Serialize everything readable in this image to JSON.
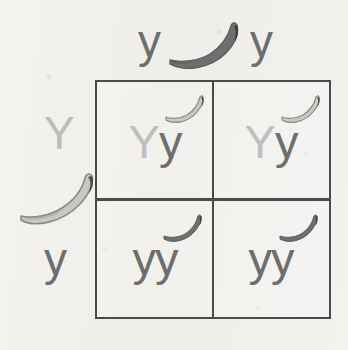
{
  "diagram": {
    "type": "punnett-square",
    "background_color": "#f2f1ee",
    "grid_line_color": "#4a4a4a"
  },
  "legend_colors": {
    "dominant_allele_text": "#bfbfbf",
    "recessive_allele_text": "#6e6e6e",
    "banana_light_fill": "#c9c8c4",
    "banana_light_stroke": "#8e8d89",
    "banana_dark_fill": "#6e6e6e",
    "banana_tip": "#4a4a4a"
  },
  "parents": {
    "top": {
      "alleles": [
        "y",
        "y"
      ],
      "allele_color": "#6e6e6e",
      "banana": {
        "icon": "banana-icon",
        "shade": "dark",
        "fill": "#6e6e6e"
      }
    },
    "left": {
      "alleles": [
        "Y",
        "y"
      ],
      "allele_colors": [
        "#bcbcbc",
        "#6e6e6e"
      ],
      "banana": {
        "icon": "banana-icon",
        "shade": "light",
        "fill": "#c9c8c4"
      }
    }
  },
  "cells": [
    {
      "id": "cell-top-left",
      "row": 0,
      "col": 0,
      "genotype": "Yy",
      "alleles": [
        {
          "symbol": "Y",
          "type": "dominant"
        },
        {
          "symbol": "y",
          "type": "recessive"
        }
      ],
      "banana": {
        "icon": "banana-icon",
        "shade": "light",
        "fill": "#c9c8c4"
      }
    },
    {
      "id": "cell-top-right",
      "row": 0,
      "col": 1,
      "genotype": "Yy",
      "alleles": [
        {
          "symbol": "Y",
          "type": "dominant"
        },
        {
          "symbol": "y",
          "type": "recessive"
        }
      ],
      "banana": {
        "icon": "banana-icon",
        "shade": "light",
        "fill": "#c9c8c4"
      }
    },
    {
      "id": "cell-bottom-left",
      "row": 1,
      "col": 0,
      "genotype": "yy",
      "alleles": [
        {
          "symbol": "y",
          "type": "recessive"
        },
        {
          "symbol": "y",
          "type": "recessive"
        }
      ],
      "banana": {
        "icon": "banana-icon",
        "shade": "dark",
        "fill": "#6e6e6e"
      }
    },
    {
      "id": "cell-bottom-right",
      "row": 1,
      "col": 1,
      "genotype": "yy",
      "alleles": [
        {
          "symbol": "y",
          "type": "recessive"
        },
        {
          "symbol": "y",
          "type": "recessive"
        }
      ],
      "banana": {
        "icon": "banana-icon",
        "shade": "dark",
        "fill": "#6e6e6e"
      }
    }
  ]
}
